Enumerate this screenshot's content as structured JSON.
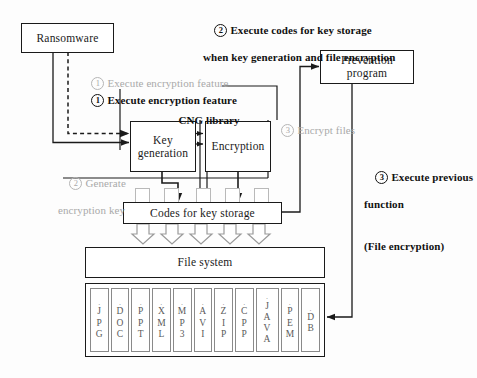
{
  "diagram": {
    "nodes": {
      "ransomware": "Ransomware",
      "prevention_program_line1": "Prevention",
      "prevention_program_line2": "program",
      "key_generation_line1": "Key",
      "key_generation_line2": "generation",
      "encryption": "Encryption",
      "codes_for_key_storage": "Codes for key storage",
      "file_system": "File system"
    },
    "labels": {
      "cng_library": "CNG library",
      "step1_ghost_num": "1",
      "step1_ghost_text": "Execute encryption feature",
      "step1_num": "1",
      "step1_text": "Execute encryption feature",
      "step2_ghost_num": "2",
      "step2_ghost_line1": "Generate",
      "step2_ghost_line2": "encryption key",
      "step3_ghost_num": "3",
      "step3_ghost_text": "Encrypt files",
      "top_step2_num": "2",
      "top_step2_line1": "Execute codes for key storage",
      "top_step2_line2": "when key generation and file encryption",
      "right_step3_num": "3",
      "right_step3_line1": "Execute previous",
      "right_step3_line2": "function",
      "right_step3_line3": "(File encryption)"
    },
    "file_types": [
      {
        "dot": ".",
        "chars": [
          "J",
          "P",
          "G"
        ]
      },
      {
        "dot": ".",
        "chars": [
          "D",
          "O",
          "C"
        ]
      },
      {
        "dot": ".",
        "chars": [
          "P",
          "P",
          "T"
        ]
      },
      {
        "dot": ".",
        "chars": [
          "X",
          "M",
          "L"
        ]
      },
      {
        "dot": ".",
        "chars": [
          "M",
          "P",
          "3"
        ]
      },
      {
        "dot": ".",
        "chars": [
          "A",
          "V",
          "I"
        ]
      },
      {
        "dot": ".",
        "chars": [
          "Z",
          "I",
          "P"
        ]
      },
      {
        "dot": ".",
        "chars": [
          "C",
          "P",
          "P"
        ]
      },
      {
        "dot": ".",
        "chars": [
          "J",
          "A",
          "V",
          "A"
        ]
      },
      {
        "dot": ".",
        "chars": [
          "P",
          "E",
          "M"
        ]
      },
      {
        "dot": ".",
        "chars": [
          "D",
          "B"
        ]
      }
    ],
    "colors": {
      "stroke": "#1a1a1a",
      "ghost_text": "#a9a9a9",
      "stub_border": "#b9b9b9",
      "cell_border": "#8a8a8a",
      "background": "#fdfdfd"
    }
  }
}
